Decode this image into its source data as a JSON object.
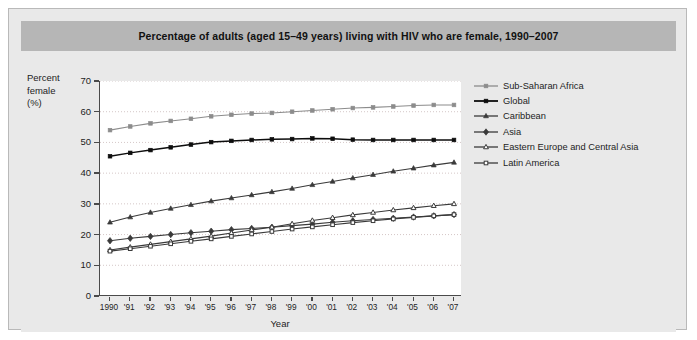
{
  "title": "Percentage of adults (aged 15–49 years) living with HIV who are female, 1990–2007",
  "axis": {
    "ylabel_line1": "Percent",
    "ylabel_line2": "female",
    "ylabel_line3": "(%)",
    "xlabel": "Year",
    "yticks": [
      "0",
      "10",
      "20",
      "30",
      "40",
      "50",
      "60",
      "70"
    ],
    "xticks": [
      "1990",
      "'91",
      "'92",
      "'93",
      "'94",
      "'95",
      "'96",
      "'97",
      "'98",
      "'99",
      "'00",
      "'01",
      "'02",
      "'03",
      "'04",
      "'05",
      "'06",
      "'07"
    ]
  },
  "legend": [
    {
      "label": "Sub-Saharan Africa",
      "marker": "filled-square",
      "color": "#8c8c8c"
    },
    {
      "label": "Global",
      "marker": "filled-square",
      "color": "#0d0d0d"
    },
    {
      "label": "Caribbean",
      "marker": "filled-triangle",
      "color": "#3a3a3a"
    },
    {
      "label": "Asia",
      "marker": "filled-diamond",
      "color": "#3a3a3a"
    },
    {
      "label": "Eastern Europe and Central Asia",
      "marker": "open-triangle",
      "color": "#3a3a3a"
    },
    {
      "label": "Latin America",
      "marker": "open-square",
      "color": "#3a3a3a"
    }
  ],
  "chart_data": {
    "type": "line",
    "title": "Percentage of adults (aged 15–49 years) living with HIV who are female, 1990–2007",
    "xlabel": "Year",
    "ylabel": "Percent female (%)",
    "x": [
      1990,
      1991,
      1992,
      1993,
      1994,
      1995,
      1996,
      1997,
      1998,
      1999,
      2000,
      2001,
      2002,
      2003,
      2004,
      2005,
      2006,
      2007
    ],
    "categories": [
      "1990",
      "'91",
      "'92",
      "'93",
      "'94",
      "'95",
      "'96",
      "'97",
      "'98",
      "'99",
      "'00",
      "'01",
      "'02",
      "'03",
      "'04",
      "'05",
      "'06",
      "'07"
    ],
    "ylim": [
      0,
      70
    ],
    "ytick_step": 10,
    "grid": "horizontal-dotted",
    "legend_position": "right",
    "series": [
      {
        "name": "Sub-Saharan Africa",
        "color": "#8c8c8c",
        "marker": "filled-square",
        "values": [
          54.0,
          55.2,
          56.2,
          57.0,
          57.7,
          58.5,
          59.0,
          59.4,
          59.6,
          60.0,
          60.4,
          60.8,
          61.2,
          61.4,
          61.7,
          62.0,
          62.2,
          62.2
        ]
      },
      {
        "name": "Global",
        "color": "#0d0d0d",
        "marker": "filled-square",
        "values": [
          45.5,
          46.6,
          47.5,
          48.4,
          49.3,
          50.1,
          50.5,
          50.8,
          51.0,
          51.1,
          51.3,
          51.2,
          50.9,
          50.8,
          50.8,
          50.8,
          50.8,
          50.8
        ]
      },
      {
        "name": "Caribbean",
        "color": "#3a3a3a",
        "marker": "filled-triangle",
        "values": [
          24.0,
          25.7,
          27.2,
          28.5,
          29.7,
          30.9,
          31.9,
          32.9,
          33.9,
          35.0,
          36.2,
          37.3,
          38.4,
          39.5,
          40.6,
          41.6,
          42.6,
          43.5
        ]
      },
      {
        "name": "Asia",
        "color": "#3a3a3a",
        "marker": "filled-diamond",
        "values": [
          18.0,
          18.8,
          19.4,
          20.0,
          20.6,
          21.1,
          21.6,
          22.0,
          22.4,
          22.9,
          23.4,
          24.0,
          24.5,
          24.9,
          25.3,
          25.7,
          26.1,
          26.5
        ]
      },
      {
        "name": "Eastern Europe and Central Asia",
        "color": "#3a3a3a",
        "marker": "open-triangle",
        "values": [
          15.0,
          15.9,
          16.8,
          17.7,
          18.6,
          19.5,
          20.5,
          21.5,
          22.4,
          23.5,
          24.6,
          25.5,
          26.4,
          27.2,
          28.0,
          28.7,
          29.4,
          30.0
        ]
      },
      {
        "name": "Latin America",
        "color": "#3a3a3a",
        "marker": "open-square",
        "values": [
          14.6,
          15.4,
          16.2,
          17.0,
          17.8,
          18.6,
          19.4,
          20.2,
          21.0,
          21.8,
          22.5,
          23.2,
          23.9,
          24.5,
          25.1,
          25.6,
          26.1,
          26.5
        ]
      }
    ]
  }
}
